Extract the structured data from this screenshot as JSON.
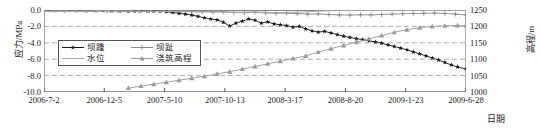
{
  "chart_data": {
    "type": "line",
    "title": "",
    "xlabel": "日期",
    "ylabel": "应力/MPa",
    "ylabel_right": "高程/m",
    "ylim": [
      -10.0,
      0.0
    ],
    "ylim_right": [
      1000,
      1250
    ],
    "grid": true,
    "legend_position": "inside-left",
    "yticks": [
      "0.0",
      "-2.0",
      "-4.0",
      "-6.0",
      "-8.0",
      "-10.0"
    ],
    "yticks_right": [
      "1250",
      "1200",
      "1150",
      "1100",
      "1050",
      "1000"
    ],
    "xticks": [
      "2006-7-2",
      "2006-12-5",
      "2007-5-10",
      "2007-10-13",
      "2008-3-17",
      "2008-8-20",
      "2009-1-23",
      "2009-6-28"
    ],
    "series": [
      {
        "name": "坝踵",
        "axis": "left",
        "color": "#1a1a1a",
        "marker": "star",
        "x": [
          0,
          0.015,
          0.03,
          0.045,
          0.06,
          0.08,
          0.1,
          0.12,
          0.14,
          0.16,
          0.18,
          0.2,
          0.215,
          0.23,
          0.245,
          0.26,
          0.275,
          0.29,
          0.305,
          0.32,
          0.335,
          0.35,
          0.365,
          0.38,
          0.395,
          0.41,
          0.425,
          0.44,
          0.455,
          0.47,
          0.485,
          0.5,
          0.515,
          0.53,
          0.545,
          0.56,
          0.575,
          0.59,
          0.605,
          0.62,
          0.635,
          0.65,
          0.665,
          0.68,
          0.695,
          0.71,
          0.725,
          0.74,
          0.755,
          0.77,
          0.785,
          0.8,
          0.815,
          0.83,
          0.845,
          0.86,
          0.875,
          0.89,
          0.905,
          0.92,
          0.935,
          0.95,
          0.965,
          0.98,
          1.0
        ],
        "values": [
          -0.05,
          -0.05,
          -0.05,
          -0.06,
          -0.06,
          -0.07,
          -0.07,
          -0.08,
          -0.08,
          -0.1,
          -0.12,
          -0.14,
          -0.13,
          -0.12,
          -0.14,
          -0.13,
          -0.15,
          -0.2,
          -0.3,
          -0.42,
          -0.5,
          -0.62,
          -0.78,
          -0.95,
          -1.1,
          -1.2,
          -1.5,
          -1.95,
          -1.6,
          -1.35,
          -1.1,
          -1.25,
          -1.6,
          -1.45,
          -1.7,
          -1.8,
          -1.9,
          -2.1,
          -2.0,
          -2.3,
          -2.55,
          -2.7,
          -2.6,
          -2.8,
          -3.0,
          -3.2,
          -3.35,
          -3.5,
          -3.6,
          -3.75,
          -3.9,
          -4.05,
          -4.25,
          -4.45,
          -4.65,
          -4.85,
          -5.1,
          -5.35,
          -5.6,
          -5.85,
          -6.1,
          -6.4,
          -6.7,
          -6.95,
          -7.2
        ]
      },
      {
        "name": "坝趾",
        "axis": "left",
        "color": "#8a8a8a",
        "marker": "plus",
        "x": [
          0,
          0.025,
          0.05,
          0.075,
          0.1,
          0.125,
          0.15,
          0.175,
          0.2,
          0.225,
          0.25,
          0.275,
          0.3,
          0.325,
          0.35,
          0.375,
          0.4,
          0.425,
          0.45,
          0.475,
          0.5,
          0.525,
          0.55,
          0.575,
          0.6,
          0.625,
          0.65,
          0.675,
          0.7,
          0.725,
          0.75,
          0.775,
          0.8,
          0.825,
          0.85,
          0.875,
          0.9,
          0.925,
          0.95,
          0.975,
          1.0
        ],
        "values": [
          -0.05,
          -0.05,
          -0.06,
          -0.05,
          -0.07,
          -0.06,
          -0.08,
          -0.07,
          -0.1,
          -0.12,
          -0.1,
          -0.13,
          -0.15,
          -0.12,
          -0.18,
          -0.2,
          -0.25,
          -0.22,
          -0.3,
          -0.32,
          -0.28,
          -0.35,
          -0.4,
          -0.38,
          -0.45,
          -0.5,
          -0.48,
          -0.55,
          -0.6,
          -0.62,
          -0.58,
          -0.6,
          -0.55,
          -0.5,
          -0.45,
          -0.42,
          -0.4,
          -0.38,
          -0.42,
          -0.5,
          -0.6
        ]
      },
      {
        "name": "水位",
        "axis": "right",
        "color": "#a8a8a8",
        "marker": "none",
        "x": [
          0,
          0.05,
          0.1,
          0.15,
          0.2,
          0.25,
          0.3,
          0.35,
          0.4,
          0.45,
          0.5,
          0.55,
          0.6,
          0.62,
          0.64,
          0.66,
          0.68,
          0.7,
          0.72,
          0.74,
          0.76,
          0.78,
          0.8,
          0.85,
          0.9,
          0.95,
          1.0
        ],
        "values": [
          1245,
          1246,
          1245,
          1247,
          1246,
          1245,
          1246,
          1244,
          1245,
          1243,
          1244,
          1242,
          1243,
          1244,
          1246,
          1247,
          1248,
          1248,
          1249,
          1248,
          1249,
          1248,
          1249,
          1248,
          1249,
          1248,
          1249
        ]
      },
      {
        "name": "浇筑高程",
        "axis": "right",
        "color": "#9a9a9a",
        "marker": "triangle",
        "x": [
          0.2,
          0.23,
          0.26,
          0.29,
          0.32,
          0.35,
          0.38,
          0.41,
          0.44,
          0.47,
          0.5,
          0.53,
          0.56,
          0.59,
          0.62,
          0.65,
          0.68,
          0.71,
          0.74,
          0.77,
          0.8,
          0.83,
          0.86,
          0.89,
          0.92,
          0.95,
          0.98,
          1.0
        ],
        "values": [
          1012,
          1018,
          1024,
          1030,
          1036,
          1042,
          1048,
          1055,
          1062,
          1070,
          1078,
          1086,
          1094,
          1102,
          1110,
          1122,
          1132,
          1142,
          1152,
          1162,
          1172,
          1182,
          1190,
          1196,
          1200,
          1202,
          1203,
          1203
        ]
      }
    ]
  }
}
